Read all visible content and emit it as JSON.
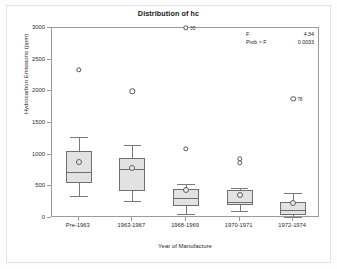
{
  "chart_data": {
    "type": "box",
    "title": "Distribution of hc",
    "xlabel": "Year of Manufacture",
    "ylabel": "Hydrocarbon Emissions (ppm)",
    "categories": [
      "Pre-1963",
      "1963-1967",
      "1968-1969",
      "1970-1971",
      "1972-1974"
    ],
    "ylim": [
      0,
      3000
    ],
    "yticks": [
      0,
      500,
      1000,
      1500,
      2000,
      2500,
      3000
    ],
    "ytick_labels": [
      "0",
      "500",
      "1000",
      "1500",
      "2000",
      "2500",
      "3000"
    ],
    "grid": false,
    "legend": "none",
    "boxes": [
      {
        "category": "Pre-1963",
        "whisker_low": 350,
        "q1": 550,
        "median": 720,
        "q3": 1060,
        "whisker_high": 1280,
        "mean": 890,
        "outliers": [
          {
            "value": 2340,
            "label": ""
          }
        ]
      },
      {
        "category": "1963-1967",
        "whisker_low": 270,
        "q1": 430,
        "median": 780,
        "q3": 940,
        "whisker_high": 1150,
        "mean": 790,
        "outliers": [
          {
            "value": 2000,
            "label": ""
          }
        ]
      },
      {
        "category": "1968-1969",
        "whisker_low": 60,
        "q1": 190,
        "median": 310,
        "q3": 460,
        "whisker_high": 540,
        "mean": 440,
        "outliers": [
          {
            "value": 3000,
            "label": "35"
          },
          {
            "value": 1090,
            "label": ""
          }
        ]
      },
      {
        "category": "1970-1971",
        "whisker_low": 105,
        "q1": 205,
        "median": 250,
        "q3": 440,
        "whisker_high": 480,
        "mean": 370,
        "outliers": [
          {
            "value": 930,
            "label": ""
          },
          {
            "value": 870,
            "label": ""
          }
        ]
      },
      {
        "category": "1972-1974",
        "whisker_low": 20,
        "q1": 50,
        "median": 130,
        "q3": 250,
        "whisker_high": 400,
        "mean": 230,
        "outliers": [
          {
            "value": 1880,
            "label": "78"
          }
        ]
      }
    ]
  },
  "annotation": {
    "rows": [
      {
        "key": "F",
        "value": "4.34"
      },
      {
        "key": "Prob > F",
        "value": "0.0033"
      }
    ]
  }
}
